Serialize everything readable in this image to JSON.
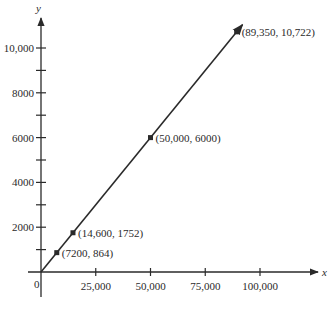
{
  "chart_data": {
    "type": "line",
    "title": "",
    "xlabel": "x",
    "ylabel": "y",
    "origin_label": "0",
    "xlim": [
      0,
      115000
    ],
    "ylim": [
      0,
      12000
    ],
    "grid": false,
    "legend": null,
    "x_ticks": [
      {
        "value": 25000,
        "label": "25,000"
      },
      {
        "value": 50000,
        "label": "50,000"
      },
      {
        "value": 75000,
        "label": "75,000"
      },
      {
        "value": 100000,
        "label": "100,000"
      }
    ],
    "y_ticks": [
      {
        "value": 2000,
        "label": "2000"
      },
      {
        "value": 4000,
        "label": "4000"
      },
      {
        "value": 6000,
        "label": "6000"
      },
      {
        "value": 8000,
        "label": "8000"
      },
      {
        "value": 10000,
        "label": "10,000"
      }
    ],
    "y_minor_ticks": [
      1000,
      3000,
      5000,
      7000,
      9000
    ],
    "series": [
      {
        "name": "y = 0.12x",
        "line_start": [
          0,
          0
        ],
        "line_end_arrow": [
          92000,
          11040
        ],
        "points": [
          {
            "x": 7200,
            "y": 864,
            "label": "(7200, 864)"
          },
          {
            "x": 14600,
            "y": 1752,
            "label": "(14,600, 1752)"
          },
          {
            "x": 50000,
            "y": 6000,
            "label": "(50,000, 6000)"
          },
          {
            "x": 89350,
            "y": 10722,
            "label": "(89,350, 10,722)"
          }
        ]
      }
    ]
  },
  "colors": {
    "axis": "#2a2a2a",
    "line": "#2a2a2a",
    "background": "#ffffff"
  }
}
